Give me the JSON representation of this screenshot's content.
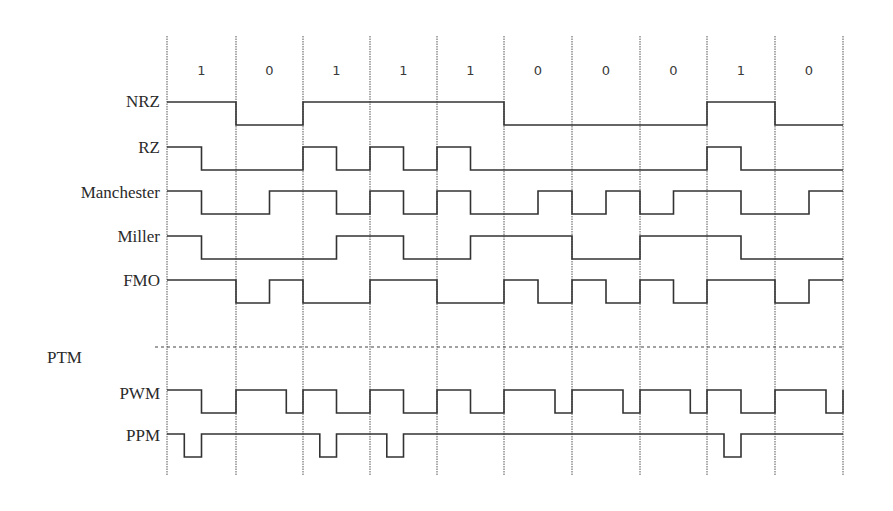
{
  "diagram": {
    "bits": [
      "1",
      "0",
      "1",
      "1",
      "1",
      "0",
      "0",
      "0",
      "1",
      "0"
    ],
    "gridlines_x": [
      167,
      236,
      303,
      370,
      437,
      504,
      572,
      640,
      707,
      775,
      843
    ],
    "grid_top": 36,
    "grid_bottom": 476,
    "separator": {
      "y": 347,
      "x_start": 155,
      "x_end": 843
    },
    "bit_label_y": 71,
    "line_color": "#333333",
    "grid_color": "#555555",
    "signals": [
      {
        "id": "nrz",
        "label": "NRZ",
        "label_y": 102,
        "high_y": 102,
        "low_y": 125,
        "resolution": 1,
        "levels": [
          1,
          0,
          1,
          1,
          1,
          0,
          0,
          0,
          1,
          0
        ]
      },
      {
        "id": "rz",
        "label": "RZ",
        "label_y": 148,
        "high_y": 147,
        "low_y": 170,
        "resolution": 2,
        "levels": [
          1,
          0,
          0,
          0,
          1,
          0,
          1,
          0,
          1,
          0,
          0,
          0,
          0,
          0,
          0,
          0,
          1,
          0,
          0,
          0
        ]
      },
      {
        "id": "manchester",
        "label": "Manchester",
        "label_y": 193,
        "high_y": 191,
        "low_y": 214,
        "resolution": 2,
        "levels": [
          1,
          0,
          0,
          1,
          1,
          0,
          1,
          0,
          1,
          0,
          0,
          1,
          0,
          1,
          0,
          1,
          1,
          0,
          0,
          1
        ]
      },
      {
        "id": "miller",
        "label": "Miller",
        "label_y": 237,
        "high_y": 236,
        "low_y": 259,
        "resolution": 2,
        "levels": [
          1,
          0,
          0,
          0,
          0,
          1,
          1,
          0,
          0,
          1,
          1,
          1,
          0,
          0,
          1,
          1,
          1,
          0,
          0,
          0
        ]
      },
      {
        "id": "fm0",
        "label": "FMO",
        "label_y": 281,
        "high_y": 280,
        "low_y": 303,
        "resolution": 2,
        "levels": [
          1,
          1,
          0,
          1,
          0,
          0,
          1,
          1,
          0,
          0,
          1,
          0,
          1,
          0,
          1,
          0,
          1,
          1,
          0,
          1
        ]
      },
      {
        "id": "pwm",
        "label": "PWM",
        "label_y": 394,
        "high_y": 390,
        "low_y": 413,
        "resolution": 4,
        "end_rise": true,
        "levels": [
          1,
          1,
          0,
          0,
          1,
          1,
          1,
          0,
          1,
          1,
          0,
          0,
          1,
          1,
          0,
          0,
          1,
          1,
          0,
          0,
          1,
          1,
          1,
          0,
          1,
          1,
          1,
          0,
          1,
          1,
          1,
          0,
          1,
          1,
          0,
          0,
          1,
          1,
          1,
          0
        ]
      },
      {
        "id": "ppm",
        "label": "PPM",
        "label_y": 436,
        "high_y": 434,
        "low_y": 457,
        "resolution": 4,
        "levels": [
          1,
          0,
          1,
          1,
          1,
          1,
          1,
          1,
          1,
          0,
          1,
          1,
          1,
          0,
          1,
          1,
          1,
          1,
          1,
          1,
          1,
          1,
          1,
          1,
          1,
          1,
          1,
          1,
          1,
          1,
          1,
          1,
          1,
          0,
          1,
          1,
          1,
          1,
          1,
          1
        ]
      }
    ],
    "section_label": {
      "text": "PTM",
      "x": 47,
      "y": 358
    }
  }
}
